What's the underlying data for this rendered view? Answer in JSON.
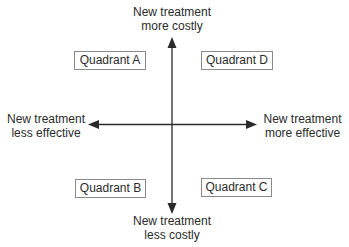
{
  "diagram": {
    "type": "cost-effectiveness plane",
    "axes": {
      "top": {
        "line1": "New treatment",
        "line2": "more costly"
      },
      "bottom": {
        "line1": "New treatment",
        "line2": "less costly"
      },
      "left": {
        "line1": "New treatment",
        "line2": "less effective"
      },
      "right": {
        "line1": "New treatment",
        "line2": "more effective"
      }
    },
    "quadrants": {
      "a": "Quadrant A",
      "b": "Quadrant B",
      "c": "Quadrant C",
      "d": "Quadrant D"
    },
    "colors": {
      "axis": "#2a2a2a",
      "box_border": "#8a8a8a",
      "text": "#2a2a2a"
    }
  }
}
